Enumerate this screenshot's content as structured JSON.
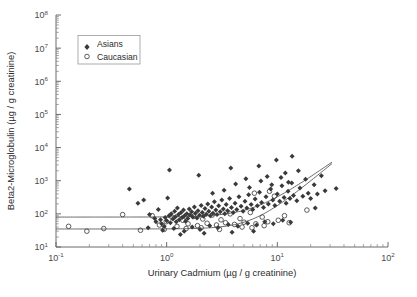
{
  "figure": {
    "background_color": "#ffffff",
    "axis_color": "#6b6b6b",
    "curve_color": "#5a5a5a"
  },
  "legend": {
    "position": "top-left-inset",
    "border_color": "#9a9a9a",
    "entries": [
      {
        "label": "Asians",
        "marker": "filled-diamond",
        "color": "#3a3a3a"
      },
      {
        "label": "Caucasian",
        "marker": "open-circle",
        "color": "#4a4a4a"
      }
    ]
  },
  "chart_data": {
    "type": "scatter",
    "title": "",
    "subtitle": "",
    "xlabel": "Urinary Cadmium (µg / g creatinine)",
    "ylabel": "Beta2-Microglobulin (µg / g creatinine)",
    "xscale": "log",
    "yscale": "log",
    "xlim": [
      0.1,
      100
    ],
    "ylim": [
      10,
      100000000
    ],
    "grid": false,
    "xticks": [
      0.1,
      1,
      10,
      100
    ],
    "xticklabels": [
      "10-1",
      "100",
      "101",
      "102"
    ],
    "xtick_exponents": [
      "-1",
      "0",
      "1",
      "2"
    ],
    "yticks": [
      10,
      100,
      1000,
      10000,
      100000,
      1000000,
      10000000,
      100000000
    ],
    "ytick_exponents": [
      "1",
      "2",
      "3",
      "4",
      "5",
      "6",
      "7",
      "8"
    ],
    "minor_ticks": true,
    "legend_position": "upper left",
    "annotations": [],
    "series": [
      {
        "name": "Asians",
        "marker": "filled-diamond",
        "color": "#3a3a3a",
        "points": [
          [
            0.62,
            260
          ],
          [
            0.7,
            95
          ],
          [
            0.78,
            72
          ],
          [
            0.8,
            58
          ],
          [
            0.84,
            135
          ],
          [
            0.88,
            66
          ],
          [
            0.9,
            50
          ],
          [
            0.95,
            42
          ],
          [
            0.97,
            78
          ],
          [
            1.0,
            62
          ],
          [
            1.02,
            300
          ],
          [
            1.05,
            88
          ],
          [
            1.08,
            54
          ],
          [
            1.1,
            100
          ],
          [
            1.14,
            70
          ],
          [
            1.18,
            120
          ],
          [
            1.2,
            82
          ],
          [
            1.22,
            58
          ],
          [
            1.25,
            150
          ],
          [
            1.28,
            95
          ],
          [
            1.3,
            66
          ],
          [
            1.35,
            110
          ],
          [
            1.38,
            78
          ],
          [
            1.42,
            130
          ],
          [
            1.45,
            88
          ],
          [
            1.48,
            60
          ],
          [
            1.52,
            100
          ],
          [
            1.55,
            72
          ],
          [
            1.6,
            140
          ],
          [
            1.62,
            92
          ],
          [
            1.68,
            115
          ],
          [
            1.72,
            80
          ],
          [
            1.78,
            160
          ],
          [
            1.82,
            105
          ],
          [
            1.88,
            75
          ],
          [
            1.92,
            125
          ],
          [
            1.98,
            90
          ],
          [
            2.05,
            180
          ],
          [
            2.1,
            110
          ],
          [
            2.15,
            85
          ],
          [
            2.22,
            145
          ],
          [
            2.28,
            98
          ],
          [
            2.35,
            200
          ],
          [
            2.4,
            120
          ],
          [
            2.48,
            88
          ],
          [
            2.55,
            160
          ],
          [
            2.62,
            105
          ],
          [
            2.7,
            230
          ],
          [
            2.78,
            130
          ],
          [
            2.85,
            95
          ],
          [
            2.95,
            175
          ],
          [
            3.05,
            115
          ],
          [
            3.15,
            260
          ],
          [
            3.25,
            140
          ],
          [
            3.35,
            100
          ],
          [
            3.45,
            190
          ],
          [
            3.55,
            125
          ],
          [
            3.7,
            290
          ],
          [
            3.85,
            155
          ],
          [
            4.0,
            110
          ],
          [
            4.15,
            210
          ],
          [
            4.3,
            135
          ],
          [
            4.5,
            330
          ],
          [
            4.7,
            170
          ],
          [
            4.9,
            120
          ],
          [
            5.1,
            240
          ],
          [
            5.3,
            150
          ],
          [
            5.5,
            380
          ],
          [
            5.8,
            190
          ],
          [
            6.0,
            135
          ],
          [
            6.3,
            280
          ],
          [
            6.6,
            175
          ],
          [
            6.9,
            450
          ],
          [
            7.2,
            220
          ],
          [
            7.5,
            155
          ],
          [
            7.9,
            330
          ],
          [
            8.3,
            200
          ],
          [
            8.7,
            560
          ],
          [
            9.1,
            260
          ],
          [
            9.5,
            180
          ],
          [
            10.0,
            400
          ],
          [
            10.5,
            240
          ],
          [
            11.0,
            700
          ],
          [
            11.5,
            310
          ],
          [
            12.0,
            210
          ],
          [
            12.5,
            480
          ],
          [
            13.0,
            290
          ],
          [
            13.5,
            850
          ],
          [
            14.0,
            360
          ],
          [
            15.0,
            250
          ],
          [
            16.0,
            600
          ],
          [
            17.0,
            340
          ],
          [
            18.0,
            1100
          ],
          [
            19.0,
            420
          ],
          [
            20.0,
            290
          ],
          [
            21.5,
            750
          ],
          [
            23.0,
            400
          ],
          [
            25.0,
            1400
          ],
          [
            27.0,
            500
          ],
          [
            0.46,
            560
          ],
          [
            0.55,
            210
          ],
          [
            1.06,
            2100
          ],
          [
            1.95,
            1450
          ],
          [
            3.8,
            2400
          ],
          [
            5.2,
            1150
          ],
          [
            6.8,
            2800
          ],
          [
            8.1,
            1350
          ],
          [
            9.8,
            4200
          ],
          [
            11.8,
            1700
          ],
          [
            13.6,
            5500
          ],
          [
            15.5,
            2000
          ],
          [
            4.2,
            800
          ],
          [
            5.6,
            620
          ],
          [
            7.1,
            980
          ],
          [
            8.9,
            760
          ],
          [
            10.8,
            1250
          ],
          [
            12.6,
            900
          ],
          [
            2.6,
            420
          ],
          [
            3.3,
            520
          ],
          [
            0.68,
            38
          ],
          [
            0.92,
            32
          ],
          [
            1.16,
            36
          ],
          [
            1.44,
            30
          ],
          [
            1.7,
            40
          ],
          [
            2.0,
            34
          ],
          [
            2.45,
            44
          ],
          [
            2.9,
            38
          ],
          [
            3.6,
            48
          ],
          [
            4.4,
            42
          ],
          [
            5.4,
            52
          ],
          [
            6.5,
            46
          ],
          [
            7.7,
            58
          ],
          [
            9.2,
            50
          ],
          [
            11.2,
            64
          ],
          [
            13.2,
            56
          ],
          [
            1.33,
            24
          ],
          [
            2.18,
            26
          ],
          [
            3.9,
            28
          ],
          [
            6.1,
            30
          ],
          [
            22.0,
            150
          ],
          [
            34.0,
            580
          ]
        ]
      },
      {
        "name": "Caucasian",
        "marker": "open-circle",
        "color": "#4a4a4a",
        "points": [
          [
            0.13,
            42
          ],
          [
            0.19,
            30
          ],
          [
            0.27,
            36
          ],
          [
            0.4,
            95
          ],
          [
            0.58,
            32
          ],
          [
            0.74,
            88
          ],
          [
            0.86,
            46
          ],
          [
            0.99,
            58
          ],
          [
            1.12,
            78
          ],
          [
            1.24,
            42
          ],
          [
            1.4,
            64
          ],
          [
            1.56,
            50
          ],
          [
            1.75,
            84
          ],
          [
            1.9,
            44
          ],
          [
            2.12,
            70
          ],
          [
            2.32,
            52
          ],
          [
            2.58,
            92
          ],
          [
            2.82,
            46
          ],
          [
            3.1,
            66
          ],
          [
            3.4,
            54
          ],
          [
            3.75,
            100
          ],
          [
            4.1,
            48
          ],
          [
            4.6,
            72
          ],
          [
            5.0,
            56
          ],
          [
            5.7,
            110
          ],
          [
            6.4,
            50
          ],
          [
            7.3,
            80
          ],
          [
            8.2,
            58
          ],
          [
            9.4,
            340
          ],
          [
            10.2,
            64
          ],
          [
            11.6,
            88
          ],
          [
            12.8,
            54
          ],
          [
            2.05,
            38
          ],
          [
            4.8,
            40
          ],
          [
            7.6,
            44
          ],
          [
            0.95,
            34
          ],
          [
            8.5,
            480
          ],
          [
            6.2,
            420
          ],
          [
            18.5,
            130
          ],
          [
            1.5,
            36
          ],
          [
            3.0,
            34
          ],
          [
            5.9,
            38
          ]
        ]
      }
    ],
    "fit_curves": [
      {
        "name": "upper-fit",
        "baseline": 80,
        "description": "sigmoid fitted curve, flat baseline then rising above ~3 ug/g Cd"
      },
      {
        "name": "lower-fit",
        "baseline": 35,
        "description": "sigmoid fitted curve, flat baseline then rising above ~4 ug/g Cd"
      }
    ]
  }
}
